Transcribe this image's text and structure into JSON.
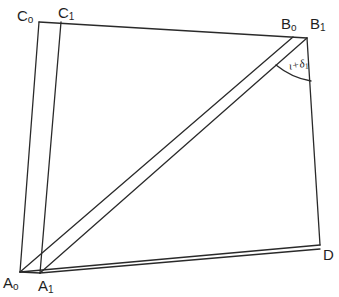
{
  "figure": {
    "type": "geometric-diagram",
    "vertices": [
      {
        "id": "C0",
        "letter": "C",
        "sub": "o",
        "x": 39,
        "y": 22
      },
      {
        "id": "C1",
        "letter": "C",
        "sub": "1",
        "x": 61,
        "y": 22
      },
      {
        "id": "B0",
        "letter": "B",
        "sub": "o",
        "x": 293,
        "y": 37
      },
      {
        "id": "B1",
        "letter": "B",
        "sub": "1",
        "x": 307,
        "y": 38
      },
      {
        "id": "A0",
        "letter": "A",
        "sub": "o",
        "x": 20,
        "y": 272
      },
      {
        "id": "A1",
        "letter": "A",
        "sub": "1",
        "x": 40,
        "y": 273
      },
      {
        "id": "D",
        "letter": "D",
        "sub": "",
        "x": 320,
        "y": 245
      }
    ],
    "edges": [
      [
        "C0",
        "B1"
      ],
      [
        "C0",
        "A0"
      ],
      [
        "C1",
        "A1"
      ],
      [
        "A0",
        "B0"
      ],
      [
        "A1",
        "B1"
      ],
      [
        "B1",
        "D"
      ],
      [
        "A0",
        "D"
      ],
      [
        "A1",
        "D"
      ],
      [
        "A0",
        "A1"
      ]
    ],
    "angle": {
      "at": "B1",
      "label_main": "ι+δ",
      "label_sub": "1",
      "color": "#1f1f1f"
    },
    "line_color": "#2a2a2a"
  },
  "labels": {
    "C0": {
      "letter": "C",
      "sub": "o"
    },
    "C1": {
      "letter": "C",
      "sub": "1"
    },
    "B0": {
      "letter": "B",
      "sub": "o"
    },
    "B1": {
      "letter": "B",
      "sub": "1"
    },
    "A0": {
      "letter": "A",
      "sub": "o"
    },
    "A1": {
      "letter": "A",
      "sub": "1"
    },
    "D": {
      "letter": "D"
    },
    "angle": {
      "main": "ι+δ",
      "sub": "1"
    }
  }
}
